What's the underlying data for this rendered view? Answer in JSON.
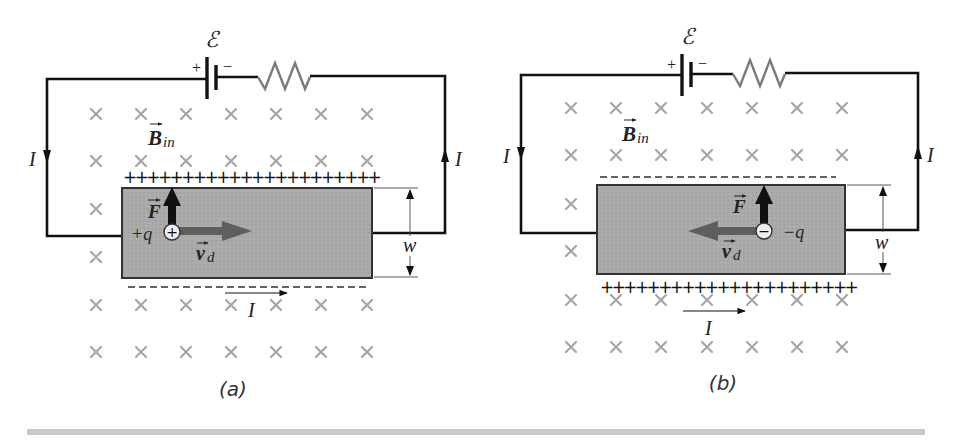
{
  "figure": {
    "panels": [
      {
        "id": "a",
        "caption": "(a)",
        "emf_label": "ℰ",
        "battery_plus": "+",
        "battery_minus": "−",
        "field_label_main": "B",
        "field_label_sub": "in",
        "current_label": "I",
        "force_label": "F",
        "charge_label": "+q",
        "charge_symbol": "+",
        "velocity_label_main": "v",
        "velocity_label_sub": "d",
        "width_label": "w",
        "top_edge_charges": "++++++++++++++++++++++",
        "bottom_edge_charges": "negative (dashes)",
        "drift_direction": "right",
        "force_direction": "up"
      },
      {
        "id": "b",
        "caption": "(b)",
        "emf_label": "ℰ",
        "battery_plus": "+",
        "battery_minus": "−",
        "field_label_main": "B",
        "field_label_sub": "in",
        "current_label": "I",
        "force_label": "F",
        "charge_label": "−q",
        "charge_symbol": "−",
        "velocity_label_main": "v",
        "velocity_label_sub": "d",
        "width_label": "w",
        "top_edge_charges": "negative (dashes)",
        "bottom_edge_charges": "++++++++++++++++++++++",
        "drift_direction": "left",
        "force_direction": "up"
      }
    ],
    "colors": {
      "wire": "#111111",
      "conductor_fill": "#a9a9a9",
      "conductor_stroke": "#333333",
      "field_x": "#a6a6a6",
      "resistor": "#7a7a7a",
      "drift_arrow": "#5e5e5e",
      "footer_bar": "#c8c8c8"
    }
  }
}
